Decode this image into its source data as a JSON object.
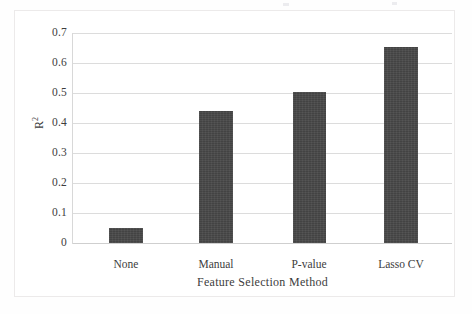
{
  "chart_data": {
    "type": "bar",
    "title": "",
    "xlabel": "Feature Selection Method",
    "ylabel": "R²",
    "ylabel_base": "R",
    "ylabel_exponent": "2",
    "categories": [
      "None",
      "Manual",
      "P-value",
      "Lasso CV"
    ],
    "values": [
      0.05,
      0.44,
      0.505,
      0.655
    ],
    "series": [
      {
        "name": "R²",
        "values": [
          0.05,
          0.44,
          0.505,
          0.655
        ]
      }
    ],
    "ylim": [
      0,
      0.7
    ],
    "ytick_labels": [
      "0.7",
      "0.6",
      "0.5",
      "0.4",
      "0.3",
      "0.2",
      "0.1",
      "0"
    ],
    "ytick_values": [
      0.7,
      0.6,
      0.5,
      0.4,
      0.3,
      0.2,
      0.1,
      0
    ],
    "grid": true,
    "grid_axis": "y",
    "legend": false,
    "legend_position": "none",
    "bar_color": "#434343",
    "grid_color": "#dcdcdc",
    "axis_color": "#d8d8d8",
    "background_color": "#ffffff",
    "frame_border_color": "#eceaea"
  }
}
